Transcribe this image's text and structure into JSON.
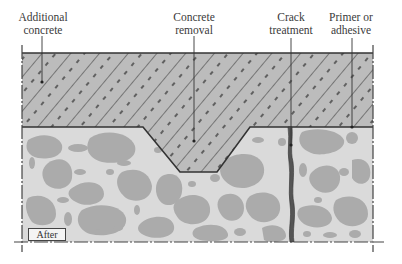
{
  "diagram": {
    "type": "concrete-repair-cross-section",
    "state_label": "After",
    "labels": [
      {
        "id": "additional-concrete",
        "line1": "Additional",
        "line2": "concrete"
      },
      {
        "id": "concrete-removal",
        "line1": "Concrete",
        "line2": "removal"
      },
      {
        "id": "crack-treatment",
        "line1": "Crack",
        "line2": "treatment"
      },
      {
        "id": "primer-adhesive",
        "line1": "Primer or",
        "line2": "adhesive"
      }
    ],
    "colors": {
      "overlay_fill": "#b9b9b9",
      "substrate_fill": "#d9d9d9",
      "aggregate_fill": "#a9a9a9",
      "line": "#333333",
      "crack_fill": "#555555"
    }
  }
}
